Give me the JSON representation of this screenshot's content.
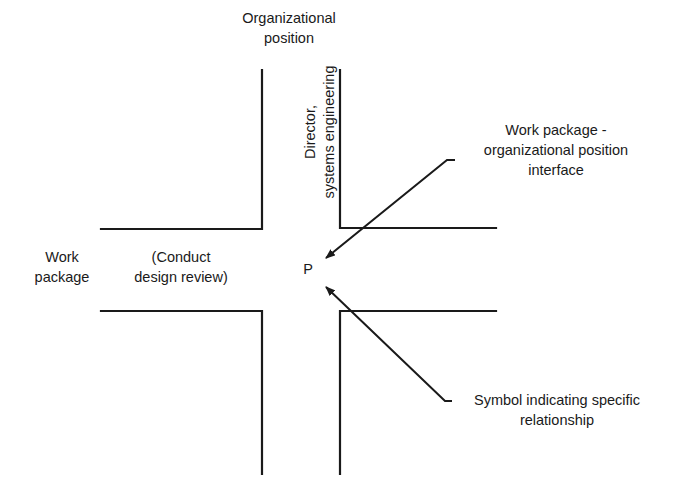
{
  "diagram": {
    "top_label": [
      "Organizational",
      "position"
    ],
    "vertical_label": [
      "Director,",
      "systems engineering"
    ],
    "left_label": [
      "Work",
      "package"
    ],
    "left_inner_label": [
      "(Conduct",
      "design review)"
    ],
    "center_symbol": "P",
    "callout_top": [
      "Work package -",
      "organizational position",
      "interface"
    ],
    "callout_bottom": [
      "Symbol indicating specific",
      "relationship"
    ],
    "colors": {
      "line": "#1a1a1a",
      "background": "#ffffff"
    }
  }
}
